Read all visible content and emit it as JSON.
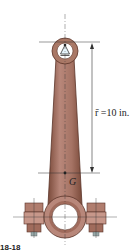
{
  "diagram": {
    "labels": {
      "r_bar": "r̄ =10 in.",
      "center_of_mass": "G",
      "figure": "18-18"
    },
    "colors": {
      "rod": "#a97866",
      "rod_dark": "#7a4a3a",
      "rod_light": "#c9a093",
      "bore": "#ffffff",
      "bolt": "#b07d6e",
      "line": "#333333"
    }
  }
}
